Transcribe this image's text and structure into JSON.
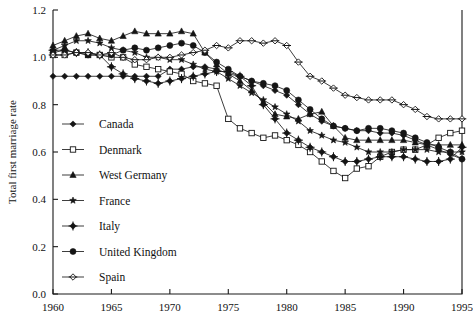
{
  "chart_data": {
    "type": "line",
    "title": "",
    "xlabel": "",
    "ylabel": "Total first marriage rate",
    "xlim": [
      1960,
      1995
    ],
    "ylim": [
      0.0,
      1.2
    ],
    "xticks": [
      1960,
      1965,
      1970,
      1975,
      1980,
      1985,
      1990,
      1995
    ],
    "yticks": [
      0.0,
      0.2,
      0.4,
      0.6,
      0.8,
      1.0,
      1.2
    ],
    "ytick_labels": [
      "0.0",
      "0.2",
      "0.4",
      "0.6",
      "0.8",
      "1.0",
      "1.2"
    ],
    "xtick_labels": [
      "1960",
      "1965",
      "1970",
      "1975",
      "1980",
      "1985",
      "1990",
      "1995"
    ],
    "grid": false,
    "legend_position": "inside-left",
    "x": [
      1960,
      1961,
      1962,
      1963,
      1964,
      1965,
      1966,
      1967,
      1968,
      1969,
      1970,
      1971,
      1972,
      1973,
      1974,
      1975,
      1976,
      1977,
      1978,
      1979,
      1980,
      1981,
      1982,
      1983,
      1984,
      1985,
      1986,
      1987,
      1988,
      1989,
      1990,
      1991,
      1992,
      1993,
      1994,
      1995
    ],
    "series": [
      {
        "name": "Canada",
        "marker": "filled-diamond",
        "values": [
          0.92,
          0.92,
          0.92,
          0.92,
          0.92,
          0.92,
          0.92,
          0.92,
          0.92,
          0.92,
          0.95,
          0.95,
          0.96,
          0.96,
          0.95,
          0.93,
          0.92,
          0.9,
          0.88,
          0.86,
          0.84,
          0.8,
          0.76,
          0.73,
          0.71,
          0.7,
          0.69,
          0.69,
          0.68,
          0.68,
          0.67,
          0.65,
          0.63,
          0.61,
          0.59,
          0.57
        ]
      },
      {
        "name": "Denmark",
        "marker": "open-square",
        "values": [
          1.01,
          1.01,
          1.02,
          1.01,
          1.01,
          1.0,
          1.0,
          0.97,
          0.96,
          0.95,
          0.94,
          0.93,
          0.9,
          0.89,
          0.88,
          0.74,
          0.7,
          0.68,
          0.66,
          0.67,
          0.65,
          0.63,
          0.6,
          0.56,
          0.52,
          0.49,
          0.53,
          0.54,
          0.58,
          0.6,
          0.61,
          0.61,
          0.63,
          0.66,
          0.68,
          0.69
        ]
      },
      {
        "name": "West Germany",
        "marker": "filled-triangle",
        "values": [
          1.05,
          1.07,
          1.09,
          1.1,
          1.08,
          1.07,
          1.09,
          1.11,
          1.1,
          1.1,
          1.1,
          1.11,
          1.1,
          1.02,
          0.97,
          0.93,
          0.9,
          0.86,
          0.81,
          0.76,
          0.75,
          0.74,
          0.76,
          0.77,
          0.71,
          0.66,
          0.65,
          0.65,
          0.65,
          0.65,
          0.65,
          0.64,
          0.63,
          0.63,
          0.63,
          0.63
        ]
      },
      {
        "name": "France",
        "marker": "star",
        "values": [
          1.03,
          1.05,
          1.07,
          1.07,
          1.06,
          1.04,
          1.03,
          1.02,
          1.0,
          1.0,
          0.99,
          0.99,
          0.97,
          0.95,
          0.94,
          0.91,
          0.88,
          0.85,
          0.82,
          0.79,
          0.76,
          0.73,
          0.69,
          0.67,
          0.65,
          0.64,
          0.62,
          0.6,
          0.6,
          0.6,
          0.61,
          0.61,
          0.61,
          0.6,
          0.6,
          0.6
        ]
      },
      {
        "name": "Italy",
        "marker": "cross-diamond",
        "values": [
          1.03,
          1.03,
          1.02,
          1.02,
          1.01,
          0.96,
          0.93,
          0.91,
          0.9,
          0.89,
          0.9,
          0.91,
          0.92,
          0.93,
          0.94,
          0.94,
          0.92,
          0.88,
          0.8,
          0.74,
          0.68,
          0.65,
          0.62,
          0.6,
          0.58,
          0.56,
          0.56,
          0.57,
          0.58,
          0.58,
          0.58,
          0.57,
          0.56,
          0.56,
          0.57,
          0.62
        ]
      },
      {
        "name": "United Kingdom",
        "marker": "filled-circle",
        "values": [
          1.02,
          1.03,
          1.02,
          1.01,
          1.01,
          1.01,
          1.03,
          1.04,
          1.03,
          1.04,
          1.05,
          1.06,
          1.05,
          1.02,
          0.98,
          0.95,
          0.92,
          0.9,
          0.89,
          0.88,
          0.86,
          0.82,
          0.78,
          0.74,
          0.71,
          0.7,
          0.69,
          0.7,
          0.7,
          0.69,
          0.68,
          0.66,
          0.64,
          0.62,
          0.6,
          0.57
        ]
      },
      {
        "name": "Spain",
        "marker": "open-diamond",
        "values": [
          1.01,
          1.01,
          1.02,
          1.02,
          1.01,
          1.02,
          1.0,
          0.99,
          0.99,
          1.0,
          1.0,
          1.01,
          1.02,
          1.03,
          1.05,
          1.04,
          1.07,
          1.07,
          1.06,
          1.07,
          1.05,
          0.98,
          0.92,
          0.9,
          0.87,
          0.84,
          0.83,
          0.82,
          0.82,
          0.82,
          0.8,
          0.78,
          0.75,
          0.74,
          0.74,
          0.74
        ]
      }
    ],
    "legend": [
      {
        "label": "Canada",
        "marker": "filled-diamond"
      },
      {
        "label": "Denmark",
        "marker": "open-square"
      },
      {
        "label": "West Germany",
        "marker": "filled-triangle"
      },
      {
        "label": "France",
        "marker": "star"
      },
      {
        "label": "Italy",
        "marker": "cross-diamond"
      },
      {
        "label": "United Kingdom",
        "marker": "filled-circle"
      },
      {
        "label": "Spain",
        "marker": "open-diamond"
      }
    ],
    "colors": {
      "line": "#1b1b1b",
      "axis": "#1a1a1a",
      "background": "#ffffff"
    }
  }
}
